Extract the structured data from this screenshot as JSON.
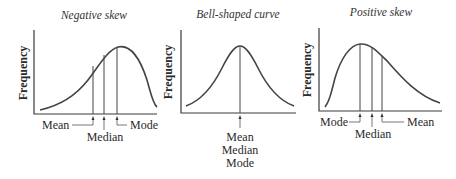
{
  "panels": [
    {
      "title": "Negative skew",
      "ylabel": "Frequency",
      "labels": {
        "mean": "Mean",
        "median": "Median",
        "mode": "Mode"
      }
    },
    {
      "title": "Bell-shaped curve",
      "ylabel": "Frequency",
      "labels": {
        "line1": "Mean",
        "line2": "Median",
        "line3": "Mode"
      }
    },
    {
      "title": "Positive skew",
      "ylabel": "Frequency",
      "labels": {
        "mode": "Mode",
        "median": "Median",
        "mean": "Mean"
      }
    }
  ],
  "colors": {
    "ink": "#333333",
    "background": "#ffffff"
  }
}
